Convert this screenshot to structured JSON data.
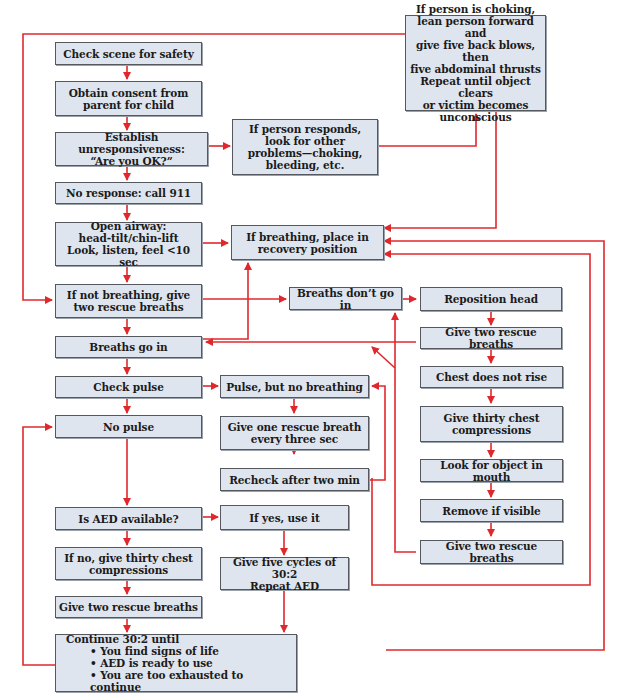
{
  "diagram": {
    "type": "flowchart",
    "line_color": "#e0282c",
    "box_fill": "#dfe5ee",
    "box_border": "#55595f",
    "nodes": {
      "check_scene": "Check scene for safety",
      "obtain_consent": "Obtain consent from\nparent for child",
      "establish_unresponsiveness": "Establish unresponsiveness:\n“Are you OK?”",
      "if_responds": "If person responds,\nlook for other\nproblems—choking,\nbleeding, etc.",
      "choking": "If person is choking,\nlean person forward and\ngive five back blows, then\nfive abdominal thrusts\nRepeat until object clears\nor victim becomes\nunconscious",
      "no_response": "No response: call 911",
      "open_airway": "Open airway:\nhead-tilt/chin-lift\nLook, listen, feel <10 sec",
      "recovery_position": "If breathing, place in\nrecovery position",
      "if_not_breathing": "If not breathing, give\ntwo rescue breaths",
      "breaths_dont_go_in": "Breaths don’t go in",
      "reposition_head": "Reposition head",
      "give_two_rescue_breaths_right": "Give two rescue breaths",
      "breaths_go_in": "Breaths go in",
      "chest_does_not_rise": "Chest does not rise",
      "check_pulse": "Check pulse",
      "pulse_no_breathing": "Pulse, but no breathing",
      "give_thirty_compressions_right": "Give thirty chest\ncompressions",
      "no_pulse": "No pulse",
      "one_breath_every_three": "Give one rescue breath\nevery three sec",
      "look_for_object": "Look for object in mouth",
      "recheck_two_min": "Recheck after two min",
      "remove_if_visible": "Remove if visible",
      "is_aed_available": "Is AED available?",
      "if_yes_use_it": "If yes, use it",
      "give_two_rescue_breaths_bottom_right": "Give two rescue breaths",
      "if_no_compressions": "If no, give thirty chest\ncompressions",
      "five_cycles": "Give five cycles of 30:2\nRepeat AED",
      "give_two_rescue_breaths_left": "Give two rescue breaths",
      "continue_title": "Continue 30:2 until",
      "continue_items": [
        "You find signs of life",
        "AED is ready to use",
        "You are too exhausted to continue"
      ]
    }
  }
}
